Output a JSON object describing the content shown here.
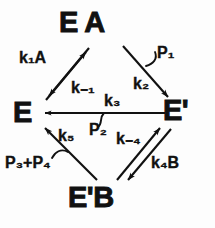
{
  "diagram": {
    "type": "reaction-scheme",
    "background_color": "#fdfdfd",
    "ink_color": "#111111",
    "nodes": [
      {
        "id": "ea",
        "label": "E A",
        "position": "top"
      },
      {
        "id": "e",
        "label": "E",
        "position": "left"
      },
      {
        "id": "ep",
        "label": "E'",
        "position": "right"
      },
      {
        "id": "epb",
        "label": "E'B",
        "position": "bottom"
      }
    ],
    "edges": [
      {
        "id": "e-to-ea",
        "from": "E",
        "to": "E A",
        "label": "k₁A",
        "label_html": "k<sub>1</sub>A",
        "direction": "up-right",
        "arrow": "single-head"
      },
      {
        "id": "ea-to-e",
        "from": "E A",
        "to": "E",
        "label": "k₋₁",
        "label_html": "k<sub>-1</sub>",
        "direction": "down-left",
        "arrow": "single-head"
      },
      {
        "id": "ea-to-ep",
        "from": "E A",
        "to": "E'",
        "label": "k₂",
        "label_html": "k<sub>2</sub>",
        "direction": "down-right",
        "arrow": "single-head",
        "release": "P₁"
      },
      {
        "id": "ep-to-e",
        "from": "E'",
        "to": "E",
        "label": "k₃",
        "label_html": "k<sub>3</sub>",
        "direction": "left",
        "arrow": "single-head",
        "release": "P₂"
      },
      {
        "id": "ep-to-epb",
        "from": "E'",
        "to": "E'B",
        "label": "k₄B",
        "label_html": "k<sub>4</sub>B",
        "direction": "down-left",
        "arrow": "single-head"
      },
      {
        "id": "epb-to-ep",
        "from": "E'B",
        "to": "E'",
        "label": "k₋₄",
        "label_html": "k<sub>-4</sub>",
        "direction": "up-right",
        "arrow": "single-head"
      },
      {
        "id": "epb-to-e",
        "from": "E'B",
        "to": "E",
        "label": "k₅",
        "label_html": "k<sub>5</sub>",
        "direction": "up-left",
        "arrow": "single-head",
        "release": "P₃+P₄"
      }
    ],
    "rate_labels": {
      "k1a": "k₁A",
      "km1": "k₋₁",
      "k2": "k₂",
      "k3": "k₃",
      "km4": "k₋₄",
      "k4b": "k₄B",
      "k5": "k₅"
    },
    "product_labels": {
      "p1": "P₁",
      "p2": "P₂",
      "p3p4": "P₃+P₄"
    }
  }
}
